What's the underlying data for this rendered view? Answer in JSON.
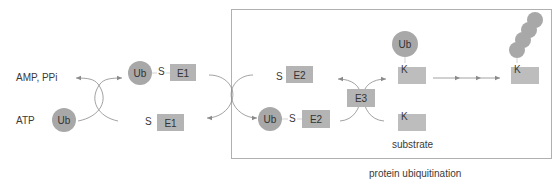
{
  "colors": {
    "ub_fill": "#a8a8a8",
    "enzyme_fill": "#b4b4b4",
    "substrate_fill": "#bdbdbd",
    "arrow": "#8a8a8a",
    "box_border": "#b0b0b0",
    "text": "#3a3a3a"
  },
  "left": {
    "amp_label": "AMP, PPi",
    "atp_label": "ATP",
    "ub_label": "Ub"
  },
  "e1": {
    "charged": {
      "ub": "Ub",
      "s": "S",
      "enzyme": "E1"
    },
    "free": {
      "s": "S",
      "enzyme": "E1"
    }
  },
  "e2": {
    "free": {
      "s": "S",
      "enzyme": "E2"
    },
    "charged": {
      "ub": "Ub",
      "s": "S",
      "enzyme": "E2"
    }
  },
  "e3": {
    "enzyme": "E3"
  },
  "substrate": {
    "ub": "Ub",
    "k_top": "K",
    "k_bottom": "K",
    "label": "substrate"
  },
  "poly": {
    "k": "K"
  },
  "caption": "protein ubiquitination"
}
